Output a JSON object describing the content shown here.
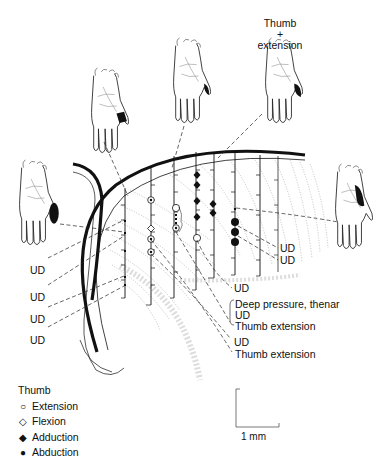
{
  "figure": {
    "top_label": {
      "line1": "Thumb",
      "line2": "+",
      "line3": "extension"
    },
    "hands": [
      {
        "id": "hand-1",
        "position": "upper-left",
        "receptive_field": "thumb base band"
      },
      {
        "id": "hand-2",
        "position": "top-center-left",
        "receptive_field": "thumb tip"
      },
      {
        "id": "hand-3",
        "position": "top-center-right",
        "receptive_field": "thumb tip",
        "label": "Thumb + extension"
      },
      {
        "id": "hand-4",
        "position": "left",
        "receptive_field": "thenar eminence"
      },
      {
        "id": "hand-5",
        "position": "right",
        "receptive_field": "thenar/thumb base"
      }
    ],
    "left_labels": [
      "UD",
      "UD",
      "UD",
      "UD"
    ],
    "right_labels": {
      "ud1": "UD",
      "ud2": "UD",
      "ud3": "UD",
      "deep_pressure": "Deep pressure, thenar",
      "ud4": "UD",
      "thumb_ext1": "Thumb extension",
      "ud5": "UD",
      "thumb_ext2": "Thumb extension"
    },
    "legend": {
      "title": "Thumb",
      "items": [
        {
          "symbol": "open-circle",
          "glyph": "○",
          "label": "Extension"
        },
        {
          "symbol": "open-diamond",
          "glyph": "◇",
          "label": "Flexion"
        },
        {
          "symbol": "filled-diamond",
          "glyph": "◆",
          "label": "Adduction"
        },
        {
          "symbol": "filled-circle",
          "glyph": "●",
          "label": "Abduction"
        }
      ]
    },
    "scale_bar": {
      "label": "1 mm"
    },
    "colors": {
      "ink": "#111111",
      "background": "#ffffff",
      "dotted": "#888888"
    }
  }
}
